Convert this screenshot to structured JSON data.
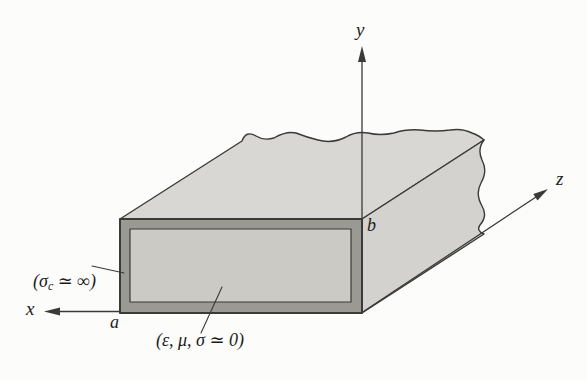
{
  "colors": {
    "background": "#fcfcfb",
    "outline": "#3a3a38",
    "top_face": "#d8d7d3",
    "side_face": "#d3d2ce",
    "wall": "#9a9993",
    "dielectric": "#cbcac5",
    "label_text": "#1b1b1b"
  },
  "axes": {
    "x_label": "x",
    "y_label": "y",
    "z_label": "z"
  },
  "dimension_labels": {
    "width": "a",
    "height": "b"
  },
  "annotations": {
    "conductor": {
      "prefix": "(σ",
      "subscript": "c",
      "suffix": " ≃ ∞)"
    },
    "dielectric": "(ε, μ, σ ≃ 0)"
  }
}
